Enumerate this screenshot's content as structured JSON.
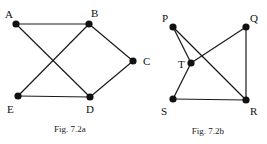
{
  "figures": [
    {
      "caption": "Fig. 7.2a",
      "caption_pos": [
        70,
        132
      ],
      "nodes": [
        {
          "id": "A",
          "x": 16,
          "y": 24,
          "lx": 5,
          "ly": 18
        },
        {
          "id": "B",
          "x": 89,
          "y": 24,
          "lx": 91,
          "ly": 17
        },
        {
          "id": "C",
          "x": 133,
          "y": 61,
          "lx": 143,
          "ly": 65
        },
        {
          "id": "E",
          "x": 18,
          "y": 96,
          "lx": 7,
          "ly": 113
        },
        {
          "id": "D",
          "x": 90,
          "y": 97,
          "lx": 86,
          "ly": 113
        }
      ],
      "edges": [
        [
          "A",
          "B"
        ],
        [
          "A",
          "D"
        ],
        [
          "E",
          "B"
        ],
        [
          "E",
          "D"
        ],
        [
          "B",
          "C"
        ],
        [
          "D",
          "C"
        ]
      ]
    },
    {
      "caption": "Fig. 7.2b",
      "caption_pos": [
        208,
        134
      ],
      "nodes": [
        {
          "id": "P",
          "x": 173,
          "y": 27,
          "lx": 162,
          "ly": 22
        },
        {
          "id": "Q",
          "x": 246,
          "y": 27,
          "lx": 250,
          "ly": 22
        },
        {
          "id": "T",
          "x": 191,
          "y": 63,
          "lx": 178,
          "ly": 68
        },
        {
          "id": "S",
          "x": 173,
          "y": 99,
          "lx": 161,
          "ly": 115
        },
        {
          "id": "R",
          "x": 246,
          "y": 100,
          "lx": 250,
          "ly": 115
        }
      ],
      "edges": [
        [
          "P",
          "T"
        ],
        [
          "P",
          "R"
        ],
        [
          "T",
          "Q"
        ],
        [
          "T",
          "S"
        ],
        [
          "S",
          "R"
        ],
        [
          "Q",
          "R"
        ]
      ]
    }
  ]
}
